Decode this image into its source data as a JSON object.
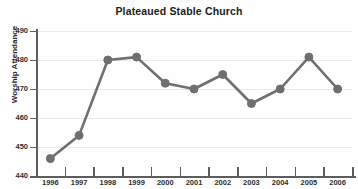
{
  "chart_data": {
    "type": "line",
    "title": "Plateaued Stable Church",
    "xlabel": "",
    "ylabel": "Worship Attendance",
    "categories": [
      "1996",
      "1997",
      "1998",
      "1999",
      "2000",
      "2001",
      "2002",
      "2003",
      "2004",
      "2005",
      "2006"
    ],
    "values": [
      446,
      454,
      480,
      481,
      472,
      470,
      475,
      465,
      470,
      481,
      470
    ],
    "series": [
      {
        "name": "Worship Attendance",
        "values": [
          446,
          454,
          480,
          481,
          472,
          470,
          475,
          465,
          470,
          481,
          470
        ]
      }
    ],
    "ylim": [
      440,
      490
    ],
    "yticks": [
      440,
      450,
      460,
      470,
      480,
      490
    ],
    "ytick_labels": [
      "440",
      "450",
      "460",
      "470",
      "480",
      "490"
    ],
    "grid": true,
    "legend": false,
    "legend_position": "none",
    "marker": "circle",
    "colors": {
      "series": "#6f6f6f",
      "axis": "#5d5d5d",
      "gridline": "#eaeaea",
      "background": "#fefefe",
      "text": "#2b2b2b"
    }
  }
}
